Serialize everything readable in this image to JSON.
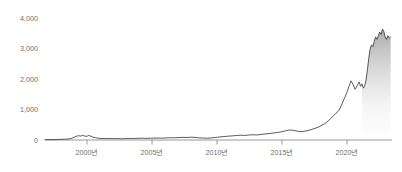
{
  "chart_data": {
    "type": "line",
    "title": "",
    "subtitle": "",
    "xlabel": "",
    "ylabel": "",
    "grid": false,
    "legend": "none",
    "legend_entries": [],
    "annotations": [],
    "xlim": [
      1997.0,
      2022.4
    ],
    "ylim": [
      0,
      4000
    ],
    "y_ticks": [
      0,
      1000,
      2000,
      3000,
      4000
    ],
    "y_tick_labels": [
      "0",
      "1,000",
      "2,000",
      "3,000",
      "4,000"
    ],
    "x_ticks": [
      2000,
      2005,
      2010,
      2015,
      2020
    ],
    "x_tick_labels": [
      "2000년",
      "2005년",
      "2010년",
      "2015년",
      "2020년"
    ],
    "line_color": "#3c3c3c",
    "area_fill_color": "#8a8a8a",
    "area_fill_start_x": 2020.15,
    "axis_color": "#8d8d8d",
    "tick_label_color": "#6f6f6f",
    "background_color": "#ffffff",
    "series": [
      {
        "name": "index",
        "x": [
          1997.0,
          1997.3,
          1997.6,
          1997.9,
          1998.2,
          1998.5,
          1998.8,
          1999.0,
          1999.15,
          1999.3,
          1999.45,
          1999.6,
          1999.75,
          1999.9,
          2000.05,
          2000.2,
          2000.35,
          2000.5,
          2000.7,
          2000.9,
          2001.1,
          2001.4,
          2001.7,
          2002.0,
          2002.3,
          2002.6,
          2002.9,
          2003.2,
          2003.5,
          2003.8,
          2004.1,
          2004.4,
          2004.7,
          2005.0,
          2005.3,
          2005.6,
          2005.9,
          2006.2,
          2006.5,
          2006.8,
          2007.1,
          2007.4,
          2007.7,
          2008.0,
          2008.3,
          2008.6,
          2008.9,
          2009.2,
          2009.5,
          2009.8,
          2010.1,
          2010.4,
          2010.7,
          2011.0,
          2011.3,
          2011.6,
          2011.9,
          2012.2,
          2012.5,
          2012.8,
          2013.1,
          2013.4,
          2013.7,
          2014.0,
          2014.3,
          2014.6,
          2014.9,
          2015.2,
          2015.5,
          2015.8,
          2016.1,
          2016.4,
          2016.7,
          2017.0,
          2017.2,
          2017.45,
          2017.7,
          2017.9,
          2018.1,
          2018.3,
          2018.5,
          2018.65,
          2018.8,
          2018.95,
          2019.1,
          2019.25,
          2019.4,
          2019.55,
          2019.7,
          2019.85,
          2020.0,
          2020.1,
          2020.2,
          2020.3,
          2020.4,
          2020.5,
          2020.6,
          2020.7,
          2020.8,
          2020.9,
          2021.0,
          2021.1,
          2021.2,
          2021.3,
          2021.4,
          2021.5,
          2021.6,
          2021.7,
          2021.8,
          2021.9,
          2022.0,
          2022.1,
          2022.2,
          2022.3
        ],
        "values": [
          10,
          14,
          12,
          18,
          22,
          26,
          40,
          62,
          95,
          120,
          142,
          128,
          150,
          132,
          118,
          150,
          126,
          96,
          74,
          58,
          52,
          46,
          50,
          44,
          48,
          42,
          46,
          52,
          48,
          56,
          60,
          54,
          58,
          62,
          66,
          60,
          70,
          76,
          72,
          80,
          86,
          82,
          92,
          84,
          70,
          62,
          58,
          70,
          86,
          100,
          114,
          126,
          134,
          148,
          156,
          150,
          162,
          172,
          166,
          180,
          196,
          210,
          228,
          246,
          268,
          300,
          330,
          316,
          286,
          272,
          296,
          330,
          372,
          420,
          470,
          530,
          610,
          700,
          790,
          880,
          960,
          1090,
          1250,
          1400,
          1560,
          1760,
          1940,
          1820,
          1660,
          1780,
          1900,
          1760,
          1840,
          1700,
          1780,
          1960,
          2300,
          2680,
          2980,
          3120,
          3060,
          3240,
          3380,
          3300,
          3420,
          3540,
          3460,
          3640,
          3560,
          3380,
          3300,
          3420,
          3340,
          3380
        ]
      }
    ]
  },
  "accessibility": {
    "chart_role": "line-chart"
  }
}
